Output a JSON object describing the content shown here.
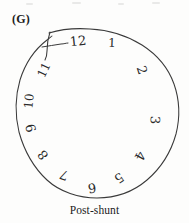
{
  "figure": {
    "panel_letter": "(G)",
    "caption": "Post-shunt",
    "type": "clock-drawing-test",
    "ink_color": "#2a2a2a",
    "background_color": "#fdfdfc"
  },
  "clock": {
    "contour_description": "hand-drawn closed wobbly circle with a crossing overshoot hook at the upper-left near 11 o'clock",
    "hands_drawn": false,
    "numerals": [
      {
        "label": "12",
        "x": 78,
        "y": 41,
        "rotate": -6,
        "size": 13
      },
      {
        "label": "1",
        "x": 112,
        "y": 43,
        "rotate": 2,
        "size": 12
      },
      {
        "label": "2",
        "x": 142,
        "y": 70,
        "rotate": 72,
        "size": 13
      },
      {
        "label": "3",
        "x": 155,
        "y": 120,
        "rotate": 92,
        "size": 13
      },
      {
        "label": "4",
        "x": 140,
        "y": 156,
        "rotate": 118,
        "size": 13
      },
      {
        "label": "5",
        "x": 119,
        "y": 178,
        "rotate": 146,
        "size": 13
      },
      {
        "label": "6",
        "x": 92,
        "y": 188,
        "rotate": 172,
        "size": 13
      },
      {
        "label": "7",
        "x": 64,
        "y": 175,
        "rotate": 200,
        "size": 13
      },
      {
        "label": "8",
        "x": 43,
        "y": 155,
        "rotate": 232,
        "size": 13
      },
      {
        "label": "9",
        "x": 31,
        "y": 128,
        "rotate": 256,
        "size": 13
      },
      {
        "label": "10",
        "x": 29,
        "y": 101,
        "rotate": 276,
        "size": 12
      },
      {
        "label": "11",
        "x": 44,
        "y": 70,
        "rotate": 296,
        "size": 12
      }
    ]
  }
}
